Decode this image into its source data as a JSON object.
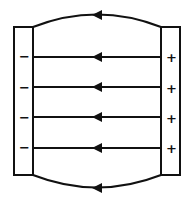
{
  "diagram": {
    "left_plate": {
      "charge": "negative",
      "labels": [
        "−",
        "−",
        "−",
        "−"
      ]
    },
    "right_plate": {
      "charge": "positive",
      "labels": [
        "+",
        "+",
        "+",
        "+"
      ]
    },
    "field_lines": {
      "straight_count": 4,
      "fringe_count": 2,
      "direction": "right-to-left (positive to negative)"
    },
    "colors": {
      "stroke": "#111111",
      "background": "#ffffff"
    }
  }
}
